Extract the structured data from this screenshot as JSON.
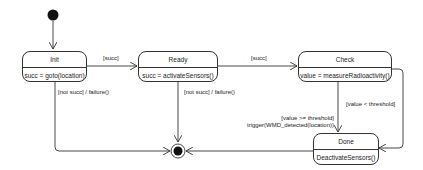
{
  "diagram": {
    "type": "uml-state-machine",
    "states": [
      {
        "id": "init",
        "name": "Init",
        "action": "succ = goto(location)"
      },
      {
        "id": "ready",
        "name": "Ready",
        "action": "succ = activateSensors()"
      },
      {
        "id": "check",
        "name": "Check",
        "action": "value = measureRadioactivity()"
      },
      {
        "id": "done",
        "name": "Done",
        "action": "DeactivateSensors()"
      }
    ],
    "transitions": [
      {
        "from": "initial",
        "to": "init",
        "label": ""
      },
      {
        "from": "init",
        "to": "ready",
        "label": "[succ]"
      },
      {
        "from": "ready",
        "to": "check",
        "label": "[succ]"
      },
      {
        "from": "init",
        "to": "final",
        "label": "[not succ] / failure()"
      },
      {
        "from": "ready",
        "to": "final",
        "label": "[not succ] / failure()"
      },
      {
        "from": "check",
        "to": "done",
        "label_line1": "[value >= threshold]",
        "label_line2": "trigger(WMD_detected(location))"
      },
      {
        "from": "check",
        "to": "done",
        "label": "[value < threshold]"
      },
      {
        "from": "done",
        "to": "final",
        "label": ""
      }
    ],
    "colors": {
      "line": "#333333",
      "node": "#111111",
      "background": "#ffffff"
    }
  }
}
